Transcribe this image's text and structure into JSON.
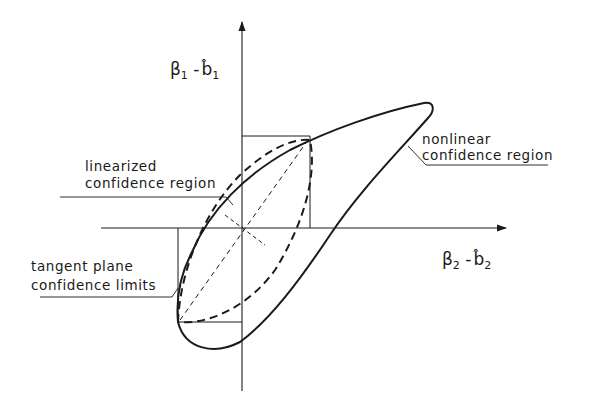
{
  "diagram": {
    "axes": {
      "y_label": {
        "symbol": "β",
        "sub": "1",
        "minus": " -",
        "est": "b̂",
        "est_sub": "1"
      },
      "x_label": {
        "symbol": "β",
        "sub": "2",
        "minus": " -",
        "est": "b̂",
        "est_sub": "2"
      }
    },
    "annotations": {
      "nonlinear": {
        "line1": "nonlinear",
        "line2": "confidence region"
      },
      "linearized": {
        "line1": "linearized",
        "line2": "confidence region"
      },
      "tangent": {
        "line1": "tangent plane",
        "line2": "confidence limits"
      }
    },
    "colors": {
      "ink": "#1a1a1a",
      "background": "#ffffff"
    }
  }
}
